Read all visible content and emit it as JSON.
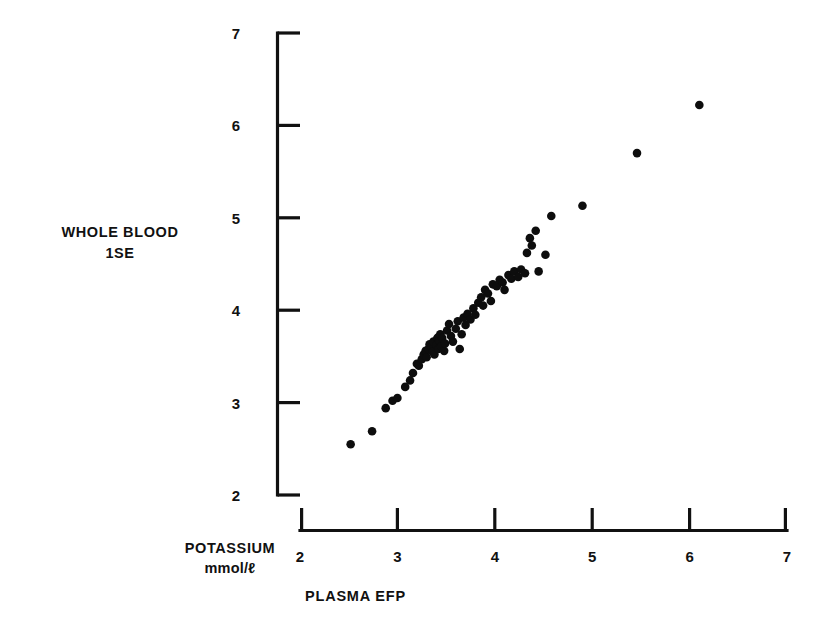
{
  "axes": {
    "y_title_line1": "WHOLE BLOOD",
    "y_title_line2": "1SE",
    "x_title_line1": "POTASSIUM",
    "x_title_line2": "mmol/ℓ",
    "x_caption": "PLASMA EFP",
    "x_ticks": [
      "2",
      "3",
      "4",
      "5",
      "6",
      "7"
    ],
    "y_ticks": [
      "2",
      "3",
      "4",
      "5",
      "6",
      "7"
    ]
  },
  "chart_data": {
    "type": "scatter",
    "title": "",
    "xlabel": "PLASMA EFP",
    "ylabel": "WHOLE BLOOD 1SE",
    "unit_label": "POTASSIUM mmol/ℓ",
    "xlim": [
      2,
      7
    ],
    "ylim": [
      2,
      7
    ],
    "xticks": [
      2,
      3,
      4,
      5,
      6,
      7
    ],
    "yticks": [
      2,
      3,
      4,
      5,
      6,
      7
    ],
    "grid": false,
    "legend": null,
    "marker": "filled-circle",
    "marker_color": "#0d0d0d",
    "series": [
      {
        "name": "Whole blood vs plasma potassium",
        "points": [
          [
            2.52,
            2.55
          ],
          [
            2.74,
            2.69
          ],
          [
            2.88,
            2.94
          ],
          [
            2.95,
            3.02
          ],
          [
            3.0,
            3.05
          ],
          [
            3.08,
            3.17
          ],
          [
            3.13,
            3.24
          ],
          [
            3.16,
            3.32
          ],
          [
            3.2,
            3.42
          ],
          [
            3.22,
            3.4
          ],
          [
            3.25,
            3.47
          ],
          [
            3.27,
            3.52
          ],
          [
            3.29,
            3.56
          ],
          [
            3.3,
            3.49
          ],
          [
            3.32,
            3.58
          ],
          [
            3.33,
            3.63
          ],
          [
            3.35,
            3.6
          ],
          [
            3.36,
            3.55
          ],
          [
            3.37,
            3.66
          ],
          [
            3.38,
            3.52
          ],
          [
            3.4,
            3.62
          ],
          [
            3.41,
            3.7
          ],
          [
            3.42,
            3.58
          ],
          [
            3.43,
            3.67
          ],
          [
            3.44,
            3.74
          ],
          [
            3.45,
            3.61
          ],
          [
            3.46,
            3.7
          ],
          [
            3.48,
            3.56
          ],
          [
            3.49,
            3.64
          ],
          [
            3.51,
            3.78
          ],
          [
            3.53,
            3.85
          ],
          [
            3.55,
            3.72
          ],
          [
            3.57,
            3.66
          ],
          [
            3.6,
            3.8
          ],
          [
            3.62,
            3.88
          ],
          [
            3.64,
            3.58
          ],
          [
            3.66,
            3.74
          ],
          [
            3.68,
            3.92
          ],
          [
            3.7,
            3.84
          ],
          [
            3.72,
            3.96
          ],
          [
            3.75,
            3.9
          ],
          [
            3.78,
            4.02
          ],
          [
            3.8,
            3.95
          ],
          [
            3.83,
            4.08
          ],
          [
            3.86,
            4.14
          ],
          [
            3.88,
            4.05
          ],
          [
            3.9,
            4.22
          ],
          [
            3.93,
            4.18
          ],
          [
            3.96,
            4.1
          ],
          [
            3.98,
            4.28
          ],
          [
            4.02,
            4.26
          ],
          [
            4.05,
            4.33
          ],
          [
            4.08,
            4.3
          ],
          [
            4.1,
            4.22
          ],
          [
            4.14,
            4.38
          ],
          [
            4.17,
            4.34
          ],
          [
            4.2,
            4.42
          ],
          [
            4.24,
            4.36
          ],
          [
            4.27,
            4.44
          ],
          [
            4.31,
            4.4
          ],
          [
            4.33,
            4.62
          ],
          [
            4.36,
            4.78
          ],
          [
            4.38,
            4.7
          ],
          [
            4.42,
            4.86
          ],
          [
            4.45,
            4.42
          ],
          [
            4.52,
            4.6
          ],
          [
            4.58,
            5.02
          ],
          [
            4.9,
            5.13
          ],
          [
            5.46,
            5.7
          ],
          [
            6.1,
            6.22
          ]
        ]
      }
    ]
  }
}
